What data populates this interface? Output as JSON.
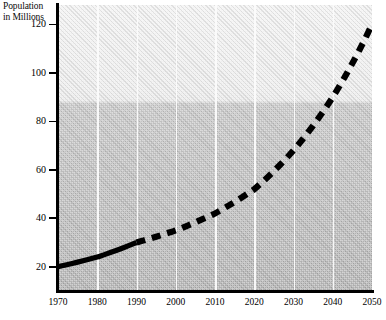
{
  "chart_data": {
    "type": "line",
    "title": "",
    "ylabel": "Population in Millions",
    "ylabel_lines": [
      "Population",
      "in Millions"
    ],
    "xlabel": "",
    "xlim": [
      1970,
      2050
    ],
    "ylim": [
      10,
      128
    ],
    "grid": "vertical-white-gridlines-at-each-decade",
    "legend": "none",
    "x_ticks": [
      1970,
      1980,
      1990,
      2000,
      2010,
      2020,
      2030,
      2040,
      2050
    ],
    "y_ticks": [
      20,
      40,
      60,
      80,
      100,
      120
    ],
    "x": [
      1970,
      1980,
      1990,
      2000,
      2010,
      2020,
      2030,
      2040,
      2050
    ],
    "values": [
      20,
      24,
      30,
      35,
      42,
      52,
      68,
      90,
      120
    ],
    "series": [
      {
        "name": "Population",
        "style": "solid",
        "note": "historical",
        "x": [
          1970,
          1980,
          1990
        ],
        "values": [
          20,
          24,
          30
        ]
      },
      {
        "name": "Population (projected)",
        "style": "dashed",
        "note": "projection",
        "x": [
          1990,
          2000,
          2010,
          2020,
          2030,
          2040,
          2050
        ],
        "values": [
          30,
          35,
          42,
          52,
          68,
          90,
          120
        ]
      }
    ],
    "colors": {
      "line": "#000000",
      "gridline": "#fbfbfb",
      "axis": "#000000",
      "plot_background_top": "#f2f2f2",
      "plot_background_bottom": "#ababab"
    }
  },
  "y_axis": {
    "title_line1": "Population",
    "title_line2": "in Millions",
    "ticks": [
      {
        "label": "120",
        "value": 120
      },
      {
        "label": "100",
        "value": 100
      },
      {
        "label": "80",
        "value": 80
      },
      {
        "label": "60",
        "value": 60
      },
      {
        "label": "40",
        "value": 40
      },
      {
        "label": "20",
        "value": 20
      }
    ]
  },
  "x_axis": {
    "ticks": [
      {
        "label": "1970",
        "value": 1970
      },
      {
        "label": "1980",
        "value": 1980
      },
      {
        "label": "1990",
        "value": 1990
      },
      {
        "label": "2000",
        "value": 2000
      },
      {
        "label": "2010",
        "value": 2010
      },
      {
        "label": "2020",
        "value": 2020
      },
      {
        "label": "2030",
        "value": 2030
      },
      {
        "label": "2040",
        "value": 2040
      },
      {
        "label": "2050",
        "value": 2050
      }
    ]
  }
}
